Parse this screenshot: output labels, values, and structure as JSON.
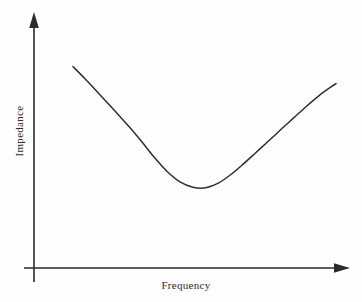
{
  "chart_data": {
    "type": "line",
    "title": "",
    "subtitle": "",
    "xlabel": "Frequency",
    "ylabel": "Impedance",
    "grid": false,
    "legend": null,
    "legend_position": "none",
    "annotations": [],
    "xtick_labels": [],
    "ytick_labels": [],
    "xlim": [
      0,
      1
    ],
    "ylim": [
      0,
      1
    ],
    "axis_style": "arrow-headed open axes (no tick marks, no numeric scale)",
    "series": [
      {
        "name": "Impedance",
        "color": "#2f2f2f",
        "x": [
          0.124,
          0.16,
          0.196,
          0.232,
          0.268,
          0.306,
          0.344,
          0.383,
          0.424,
          0.465,
          0.506,
          0.547,
          0.587,
          0.627,
          0.667,
          0.707,
          0.747,
          0.787,
          0.827,
          0.867,
          0.907,
          0.947,
          0.962
        ],
        "y": [
          0.793,
          0.748,
          0.701,
          0.653,
          0.604,
          0.552,
          0.496,
          0.436,
          0.38,
          0.339,
          0.318,
          0.316,
          0.334,
          0.368,
          0.41,
          0.455,
          0.5,
          0.546,
          0.591,
          0.636,
          0.678,
          0.714,
          0.726
        ]
      }
    ]
  },
  "labels": {
    "y_axis": "Impedance",
    "x_axis": "Frequency"
  },
  "colors": {
    "background": "#fefefe",
    "axis": "#2b2b2b",
    "curve": "#2f2f2f",
    "text": "#2b2b2b"
  }
}
